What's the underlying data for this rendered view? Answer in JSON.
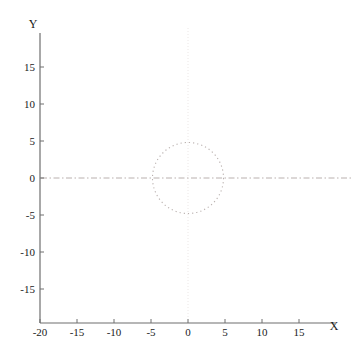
{
  "figure": {
    "background_color": "#ffffff",
    "width": 356,
    "height": 362
  },
  "chart_data": {
    "type": "line",
    "title": "",
    "subtitle": "",
    "xlabel": "X",
    "ylabel": "Y",
    "xlim": [
      -20,
      20
    ],
    "ylim": [
      -20,
      20
    ],
    "grid": false,
    "legend": null,
    "legend_position": "none",
    "xticks": [
      -20,
      -15,
      -10,
      -5,
      0,
      5,
      10,
      15
    ],
    "xtick_labels": [
      "-20",
      "-15",
      "-10",
      "-5",
      "0",
      "5",
      "10",
      "15"
    ],
    "yticks": [
      -15,
      -10,
      -5,
      0,
      5,
      10,
      15
    ],
    "ytick_labels": [
      "-15",
      "-10",
      "-5",
      "0",
      "5",
      "10",
      "15"
    ],
    "series": [
      {
        "name": "star-curve",
        "kind": "parametric-hypotrochoid",
        "color": "#2b2b2b",
        "line_width": 0.7,
        "description": "17-point star / spirograph curve traced by a rolling-circle parametric path",
        "parameters": {
          "petals": 17,
          "outer_radius": 16.0,
          "inner_radius": 4.8,
          "turns": 17,
          "samples": 1700
        },
        "outer_tip_radius": 16.0,
        "inner_notch_radius": 4.8,
        "extent_x": [
          -16.0,
          16.0
        ],
        "extent_y": [
          -16.0,
          16.0
        ]
      },
      {
        "name": "inner-dotted-circle",
        "kind": "circle",
        "color": "#b9b0ae",
        "line_style": "dotted",
        "line_width": 1.1,
        "center": [
          0,
          0
        ],
        "radius": 4.8
      }
    ],
    "reference_lines": [
      {
        "name": "y-zero-dashdot",
        "orientation": "horizontal",
        "value": 0,
        "color": "#b9b0ae",
        "line_style": "dashdot",
        "line_width": 0.9
      },
      {
        "name": "x-zero-faint",
        "orientation": "vertical",
        "value": 0,
        "color": "#ece7e6",
        "line_style": "dotted",
        "line_width": 0.9
      }
    ],
    "axis_color": "#6e6e6e",
    "tick_color": "#6e6e6e",
    "text_color": "#1a1a1a"
  },
  "axes": {
    "x_axis_name": "X",
    "y_axis_name": "Y"
  }
}
